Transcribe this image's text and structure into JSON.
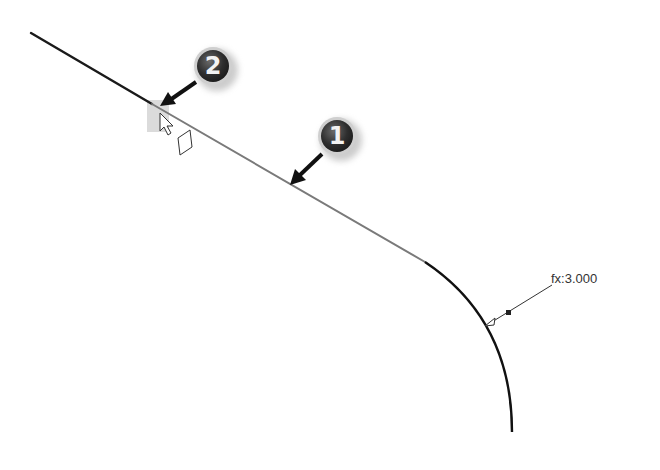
{
  "sketch": {
    "line_dark": {
      "x1": 31,
      "y1": 33,
      "x2": 152,
      "y2": 104,
      "color": "#1a1a1a"
    },
    "line_highlight": {
      "x1": 152,
      "y1": 104,
      "x2": 425,
      "y2": 262,
      "color": "#7a7a7a"
    },
    "fillet_arc": {
      "start": [
        425,
        262
      ],
      "end": [
        512,
        432
      ],
      "color": "#111111"
    }
  },
  "dimension": {
    "label": "fx:3.000",
    "leader_start": [
      487,
      325
    ],
    "leader_end": [
      552,
      285
    ],
    "node": [
      509,
      313
    ]
  },
  "callouts": [
    {
      "number": "1",
      "cx": 337,
      "cy": 136,
      "arrow_tip": [
        291,
        184
      ]
    },
    {
      "number": "2",
      "cx": 213,
      "cy": 66,
      "arrow_tip": [
        162,
        104
      ]
    }
  ],
  "cursor": {
    "icon": "arrow-pointer-icon",
    "x": 160,
    "y": 113
  },
  "constraint_glyph": {
    "icon": "coincident-constraint-icon"
  },
  "colors": {
    "badge_dark": "#3a3a3a",
    "badge_ring": "#c8c8c8",
    "highlight_box": "#c9c9c9"
  }
}
